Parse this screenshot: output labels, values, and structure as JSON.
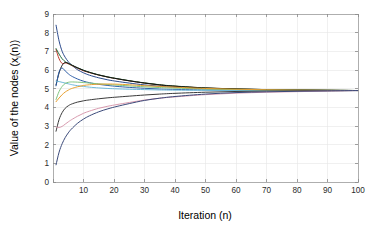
{
  "chart_data": {
    "type": "line",
    "title": "",
    "xlabel": "Iteration (n)",
    "ylabel_main": "Value of the nodes (x",
    "ylabel_sub": "i",
    "ylabel_tail": "(n))",
    "ylabel_full": "Value of the nodes (x_i(n))",
    "xlim": [
      0,
      100
    ],
    "ylim": [
      0,
      9
    ],
    "xticks": [
      0,
      10,
      20,
      30,
      40,
      50,
      60,
      70,
      80,
      90,
      100
    ],
    "xtick_labels": [
      "",
      "10",
      "20",
      "30",
      "40",
      "50",
      "60",
      "70",
      "80",
      "90",
      "100"
    ],
    "yticks": [
      0,
      1,
      2,
      3,
      4,
      5,
      6,
      7,
      8,
      9
    ],
    "ytick_labels": [
      "0",
      "1",
      "2",
      "3",
      "4",
      "5",
      "6",
      "7",
      "8",
      "9"
    ],
    "grid": true,
    "legend": "none",
    "consensus_value": 4.9,
    "x": [
      1,
      2,
      3,
      4,
      5,
      6,
      8,
      10,
      12,
      15,
      18,
      21,
      25,
      30,
      35,
      40,
      50,
      60,
      70,
      80,
      90,
      100
    ],
    "series": [
      {
        "name": "node-1",
        "color": "#2b4a8c",
        "values": [
          8.4,
          7.55,
          7.0,
          6.68,
          6.45,
          6.28,
          6.02,
          5.85,
          5.72,
          5.58,
          5.47,
          5.39,
          5.3,
          5.2,
          5.13,
          5.08,
          5.0,
          4.96,
          4.93,
          4.92,
          4.91,
          4.9
        ]
      },
      {
        "name": "node-2",
        "color": "#c0392b",
        "values": [
          7.1,
          6.6,
          6.35,
          6.38,
          6.33,
          6.25,
          6.1,
          5.96,
          5.86,
          5.73,
          5.62,
          5.53,
          5.42,
          5.3,
          5.2,
          5.13,
          5.04,
          4.98,
          4.95,
          4.93,
          4.91,
          4.9
        ]
      },
      {
        "name": "node-3",
        "color": "#1f6b3a",
        "values": [
          7.15,
          6.85,
          6.6,
          6.45,
          6.35,
          6.27,
          6.12,
          5.99,
          5.88,
          5.74,
          5.63,
          5.54,
          5.43,
          5.31,
          5.21,
          5.14,
          5.04,
          4.99,
          4.95,
          4.93,
          4.92,
          4.9
        ]
      },
      {
        "name": "node-4",
        "color": "#121212",
        "values": [
          5.2,
          5.85,
          6.25,
          6.4,
          6.36,
          6.28,
          6.12,
          5.98,
          5.87,
          5.73,
          5.62,
          5.53,
          5.42,
          5.3,
          5.2,
          5.13,
          5.03,
          4.98,
          4.95,
          4.93,
          4.91,
          4.9
        ]
      },
      {
        "name": "node-5",
        "color": "#2f5fa8",
        "values": [
          5.15,
          5.9,
          6.1,
          5.95,
          5.8,
          5.68,
          5.52,
          5.4,
          5.32,
          5.23,
          5.17,
          5.12,
          5.07,
          5.02,
          4.98,
          4.96,
          4.93,
          4.91,
          4.9,
          4.9,
          4.9,
          4.9
        ]
      },
      {
        "name": "node-6",
        "color": "#6fb8d8",
        "values": [
          5.4,
          5.38,
          5.34,
          5.3,
          5.26,
          5.22,
          5.16,
          5.12,
          5.08,
          5.04,
          5.01,
          4.99,
          4.97,
          4.95,
          4.93,
          4.92,
          4.91,
          4.9,
          4.9,
          4.9,
          4.9,
          4.9
        ]
      },
      {
        "name": "node-7",
        "color": "#7fc47f",
        "values": [
          4.42,
          4.85,
          5.12,
          5.28,
          5.34,
          5.36,
          5.35,
          5.33,
          5.3,
          5.26,
          5.22,
          5.19,
          5.15,
          5.1,
          5.06,
          5.03,
          4.98,
          4.95,
          4.93,
          4.92,
          4.91,
          4.9
        ]
      },
      {
        "name": "node-8",
        "color": "#e8a030",
        "values": [
          4.3,
          4.5,
          4.68,
          4.82,
          4.92,
          5.0,
          5.1,
          5.17,
          5.21,
          5.24,
          5.25,
          5.24,
          5.21,
          5.16,
          5.12,
          5.08,
          5.01,
          4.97,
          4.94,
          4.92,
          4.91,
          4.9
        ]
      },
      {
        "name": "node-9",
        "color": "#3a3a3a",
        "values": [
          2.72,
          3.35,
          3.72,
          3.95,
          4.08,
          4.17,
          4.28,
          4.35,
          4.4,
          4.46,
          4.51,
          4.55,
          4.6,
          4.66,
          4.71,
          4.75,
          4.81,
          4.85,
          4.87,
          4.88,
          4.89,
          4.9
        ]
      },
      {
        "name": "node-10",
        "color": "#d89aae",
        "values": [
          2.95,
          2.92,
          2.98,
          3.1,
          3.22,
          3.33,
          3.52,
          3.68,
          3.8,
          3.95,
          4.06,
          4.15,
          4.26,
          4.39,
          4.49,
          4.56,
          4.68,
          4.76,
          4.81,
          4.84,
          4.87,
          4.9
        ]
      },
      {
        "name": "node-11",
        "color": "#3b4a7a",
        "values": [
          0.92,
          1.6,
          2.05,
          2.38,
          2.63,
          2.83,
          3.14,
          3.37,
          3.55,
          3.76,
          3.92,
          4.05,
          4.2,
          4.37,
          4.49,
          4.58,
          4.71,
          4.79,
          4.83,
          4.86,
          4.88,
          4.9
        ]
      }
    ]
  }
}
